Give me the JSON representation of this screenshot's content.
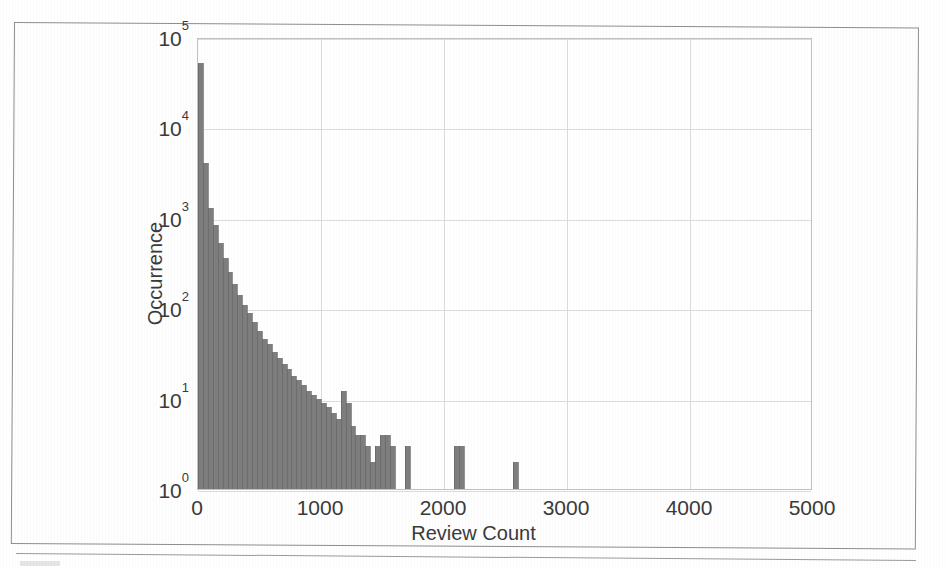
{
  "chart_data": {
    "type": "bar",
    "title": "",
    "subtitle": "",
    "xlabel": "Review Count",
    "ylabel": "Occurrence",
    "yscale": "log",
    "xscale": "linear",
    "xlim": [
      0,
      5000
    ],
    "ylim": [
      1,
      100000
    ],
    "grid": true,
    "legend": null,
    "bar_color": "#7e7e7e",
    "bin_width": 40,
    "xticks": [
      0,
      1000,
      2000,
      3000,
      4000,
      5000
    ],
    "xtick_labels": [
      "0",
      "1000",
      "2000",
      "3000",
      "4000",
      "5000"
    ],
    "yticks": [
      1,
      10,
      100,
      1000,
      10000,
      100000
    ],
    "ytick_labels": [
      "10 0",
      "10 1",
      "10 2",
      "10 3",
      "10 4",
      "10 5"
    ],
    "ytick_mantissa": "10",
    "ytick_exponents": [
      "0",
      "1",
      "2",
      "3",
      "4",
      "5"
    ],
    "x": [
      20,
      60,
      100,
      140,
      180,
      220,
      260,
      300,
      340,
      380,
      420,
      460,
      500,
      540,
      580,
      620,
      660,
      700,
      740,
      780,
      820,
      860,
      900,
      940,
      980,
      1020,
      1060,
      1100,
      1140,
      1180,
      1220,
      1260,
      1300,
      1340,
      1380,
      1420,
      1460,
      1500,
      1540,
      1580,
      1700,
      2100,
      2140,
      2580
    ],
    "values": [
      52000,
      4000,
      1300,
      830,
      520,
      360,
      250,
      185,
      140,
      108,
      88,
      70,
      56,
      46,
      40,
      33,
      28,
      24,
      21,
      18,
      16,
      14,
      12,
      11,
      10,
      9,
      8,
      7,
      6,
      12,
      9,
      5,
      4,
      4,
      3,
      2,
      3,
      4,
      4,
      3,
      3,
      3,
      3,
      2
    ]
  },
  "figure": {
    "caption_visible": false
  }
}
